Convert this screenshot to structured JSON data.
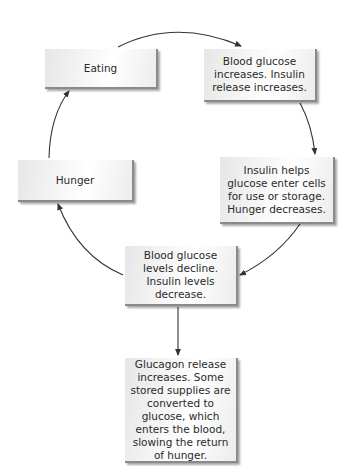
{
  "diagram": {
    "type": "cycle-flowchart",
    "nodes": [
      {
        "id": "eating",
        "label": "Eating"
      },
      {
        "id": "glucose-rise",
        "label": "Blood glucose increases. Insulin release increases."
      },
      {
        "id": "insulin-action",
        "label": "Insulin helps glucose enter cells for use or storage. Hunger decreases."
      },
      {
        "id": "glucose-decline",
        "label": "Blood glucose levels decline. Insulin levels decrease."
      },
      {
        "id": "glucagon",
        "label": "Glucagon release increases. Some stored supplies are converted to glucose, which enters the blood, slowing the return of hunger."
      },
      {
        "id": "hunger",
        "label": "Hunger"
      }
    ],
    "edges": [
      {
        "from": "eating",
        "to": "glucose-rise"
      },
      {
        "from": "glucose-rise",
        "to": "insulin-action"
      },
      {
        "from": "insulin-action",
        "to": "glucose-decline"
      },
      {
        "from": "glucose-decline",
        "to": "hunger"
      },
      {
        "from": "hunger",
        "to": "eating"
      },
      {
        "from": "glucose-decline",
        "to": "glucagon"
      }
    ],
    "colors": {
      "box_fill": "#f2f2f2",
      "box_shadow": "#8a8a8a",
      "arrow": "#333333",
      "text": "#2a2a2a"
    }
  }
}
